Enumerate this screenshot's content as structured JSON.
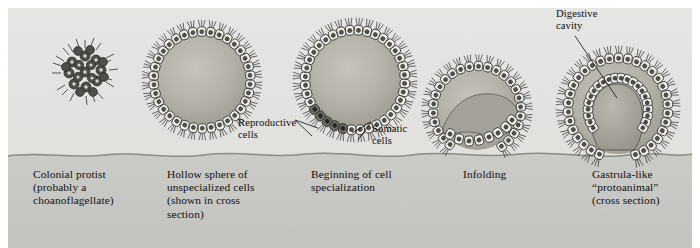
{
  "figure": {
    "kind": "biological-illustration",
    "background": {
      "upper_band_color": "#e3e3e1",
      "lower_band_color": "#c9c9c7",
      "page_color": "#ffffff",
      "ground_line_color": "#7b7b78",
      "ground_line_y": 156
    },
    "ink_color": "#2b2b2b",
    "cell_fill_color": "#f0efe9",
    "interior_fill_color": "#b6b4ac"
  },
  "stages": [
    {
      "id": "colonial-protist",
      "caption": "Colonial protist\n(probably a\nchoanoflagellate)",
      "caption_x": 33,
      "caption_y": 168,
      "center_x": 85,
      "center_y": 72,
      "radius": 22
    },
    {
      "id": "hollow-sphere",
      "caption": "Hollow sphere of\nunspecialized cells\n(shown in cross\nsection)",
      "caption_x": 167,
      "caption_y": 168,
      "center_x": 202,
      "center_y": 80,
      "radius": 53
    },
    {
      "id": "cell-specialization",
      "caption": "Beginning of cell\nspecialization",
      "caption_x": 311,
      "caption_y": 168,
      "center_x": 355,
      "center_y": 80,
      "radius": 55
    },
    {
      "id": "infolding",
      "caption": "Infolding",
      "caption_x": 463,
      "caption_y": 168,
      "center_x": 477,
      "center_y": 110,
      "radius": 48
    },
    {
      "id": "gastrula-protoanimal",
      "caption": "Gastrula-like\n“protoanimal”\n(cross section)",
      "caption_x": 592,
      "caption_y": 168,
      "center_x": 618,
      "center_y": 108,
      "radius": 52
    }
  ],
  "annotations": [
    {
      "id": "reproductive-cells",
      "text": "Reproductive\ncells",
      "x": 238,
      "y": 117,
      "leader": {
        "x1": 295,
        "y1": 120,
        "x2": 318,
        "y2": 128
      }
    },
    {
      "id": "somatic-cells",
      "text": "Somatic\ncells",
      "x": 372,
      "y": 123,
      "leader": {
        "x1": 371,
        "y1": 122,
        "x2": 352,
        "y2": 133
      }
    },
    {
      "id": "digestive-cavity",
      "text": "Digestive\ncavity",
      "x": 556,
      "y": 8,
      "leader": {
        "x1": 575,
        "y1": 36,
        "x2": 617,
        "y2": 98
      }
    }
  ]
}
